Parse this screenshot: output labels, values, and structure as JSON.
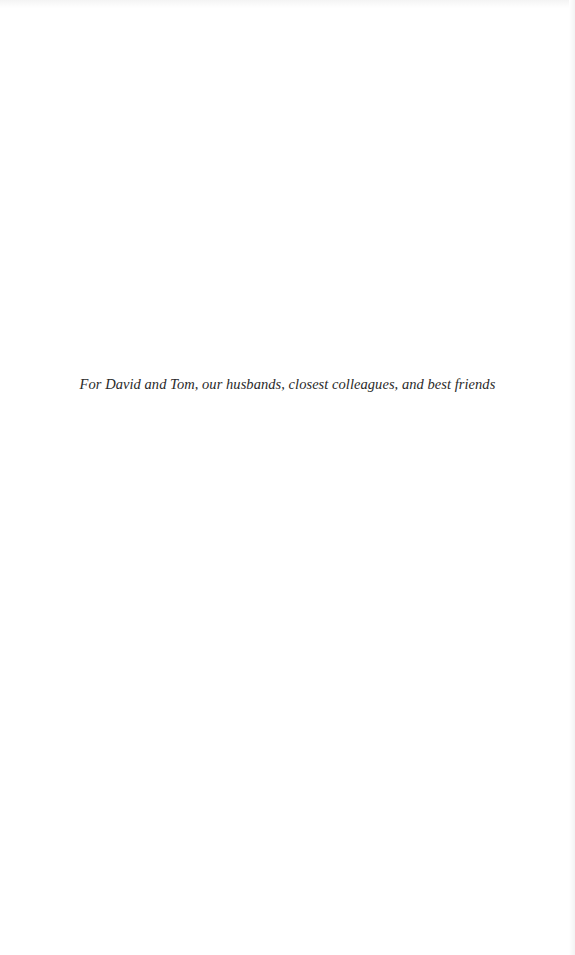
{
  "page": {
    "type": "dedication",
    "dedication_text": "For David and Tom, our husbands, closest colleagues, and best friends"
  }
}
